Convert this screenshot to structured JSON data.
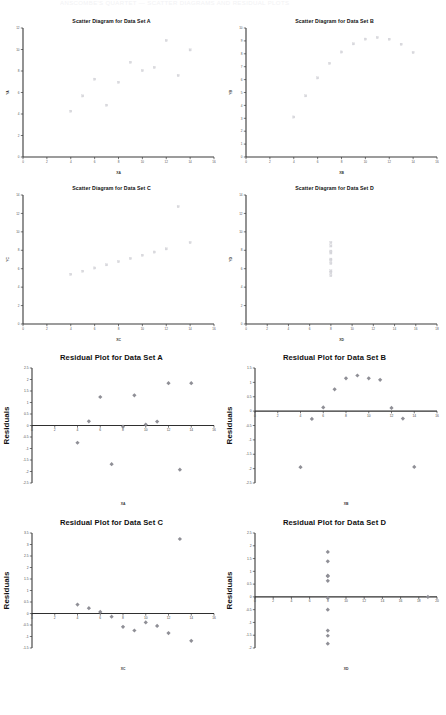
{
  "page": {
    "header_text": "ANSCOMBE'S QUARTET — SCATTER DIAGRAMS AND RESIDUAL PLOTS",
    "background": "#ffffff",
    "scatter_marker_color": "#d9d9de",
    "residual_marker_color": "#8f8f96",
    "axis_color": "#3a3a3a"
  },
  "chart_data": [
    {
      "id": "scatter-a",
      "type": "scatter",
      "title": "Scatter Diagram for Data Set A",
      "xlabel": "XA",
      "ylabel": "YA",
      "xlim": [
        0,
        16
      ],
      "ylim": [
        0,
        12
      ],
      "xticks": [
        0,
        2,
        4,
        6,
        8,
        10,
        12,
        14,
        16
      ],
      "yticks": [
        0,
        2,
        4,
        6,
        8,
        10,
        12
      ],
      "grid": false,
      "legend": "none",
      "x": [
        10,
        8,
        13,
        9,
        11,
        14,
        6,
        4,
        12,
        7,
        5
      ],
      "y": [
        8.04,
        6.95,
        7.58,
        8.81,
        8.33,
        9.96,
        7.24,
        4.26,
        10.84,
        4.82,
        5.68
      ]
    },
    {
      "id": "scatter-b",
      "type": "scatter",
      "title": "Scatter Diagram for Data Set B",
      "xlabel": "XB",
      "ylabel": "YB",
      "xlim": [
        0,
        16
      ],
      "ylim": [
        0,
        10
      ],
      "xticks": [
        0,
        2,
        4,
        6,
        8,
        10,
        12,
        14,
        16
      ],
      "yticks": [
        0,
        1,
        2,
        3,
        4,
        5,
        6,
        7,
        8,
        9,
        10
      ],
      "grid": false,
      "legend": "none",
      "x": [
        10,
        8,
        13,
        9,
        11,
        14,
        6,
        4,
        12,
        7,
        5
      ],
      "y": [
        9.14,
        8.14,
        8.74,
        8.77,
        9.26,
        8.1,
        6.13,
        3.1,
        9.13,
        7.26,
        4.74
      ]
    },
    {
      "id": "scatter-c",
      "type": "scatter",
      "title": "Scatter Diagram for Data Set C",
      "xlabel": "XC",
      "ylabel": "YC",
      "xlim": [
        0,
        16
      ],
      "ylim": [
        0,
        14
      ],
      "xticks": [
        0,
        2,
        4,
        6,
        8,
        10,
        12,
        14,
        16
      ],
      "yticks": [
        0,
        2,
        4,
        6,
        8,
        10,
        12,
        14
      ],
      "grid": false,
      "legend": "none",
      "x": [
        10,
        8,
        13,
        9,
        11,
        14,
        6,
        4,
        12,
        7,
        5
      ],
      "y": [
        7.46,
        6.77,
        12.74,
        7.11,
        7.81,
        8.84,
        6.08,
        5.39,
        8.15,
        6.42,
        5.73
      ]
    },
    {
      "id": "scatter-d",
      "type": "scatter",
      "title": "Scatter Diagram for Data Set D",
      "xlabel": "XD",
      "ylabel": "YD",
      "xlim": [
        0,
        18
      ],
      "ylim": [
        0,
        14
      ],
      "xticks": [
        0,
        2,
        4,
        6,
        8,
        10,
        12,
        14,
        16,
        18
      ],
      "yticks": [
        0,
        2,
        4,
        6,
        8,
        10,
        12,
        14
      ],
      "grid": false,
      "legend": "none",
      "x": [
        8,
        8,
        8,
        8,
        8,
        8,
        8,
        19,
        8,
        8,
        8
      ],
      "y": [
        6.58,
        5.76,
        7.71,
        8.84,
        8.47,
        7.04,
        5.25,
        12.5,
        5.56,
        7.91,
        6.89
      ]
    },
    {
      "id": "residual-a",
      "type": "scatter",
      "title": "Residual Plot for Data Set A",
      "xlabel": "XA",
      "ylabel": "Residuals",
      "xlim": [
        0,
        16
      ],
      "ylim": [
        -2.5,
        2.5
      ],
      "xticks": [
        0,
        2,
        4,
        6,
        8,
        10,
        12,
        14,
        16
      ],
      "yticks": [
        -2.5,
        -2,
        -1.5,
        -1,
        -0.5,
        0,
        0.5,
        1,
        1.5,
        2,
        2.5
      ],
      "grid": false,
      "legend": "none",
      "x": [
        10,
        8,
        13,
        9,
        11,
        14,
        6,
        4,
        12,
        7,
        5
      ],
      "y": [
        0.04,
        -0.05,
        -1.92,
        1.31,
        0.17,
        1.84,
        1.24,
        -0.75,
        1.84,
        -1.68,
        0.18
      ]
    },
    {
      "id": "residual-b",
      "type": "scatter",
      "title": "Residual Plot for Data Set B",
      "xlabel": "XB",
      "ylabel": "Residuals",
      "xlim": [
        0,
        16
      ],
      "ylim": [
        -2.5,
        1.5
      ],
      "xticks": [
        0,
        2,
        4,
        6,
        8,
        10,
        12,
        14,
        16
      ],
      "yticks": [
        -2.5,
        -2,
        -1.5,
        -1,
        -0.5,
        0,
        0.5,
        1,
        1.5
      ],
      "grid": false,
      "legend": "none",
      "x": [
        10,
        8,
        13,
        9,
        11,
        14,
        6,
        4,
        12,
        7,
        5
      ],
      "y": [
        1.14,
        1.14,
        -0.26,
        1.24,
        1.09,
        -1.94,
        0.13,
        -1.95,
        0.11,
        0.76,
        -0.27
      ]
    },
    {
      "id": "residual-c",
      "type": "scatter",
      "title": "Residual Plot for Data Set C",
      "xlabel": "XC",
      "ylabel": "Residuals",
      "xlim": [
        0,
        16
      ],
      "ylim": [
        -1.5,
        3.5
      ],
      "xticks": [
        0,
        2,
        4,
        6,
        8,
        10,
        12,
        14,
        16
      ],
      "yticks": [
        -1.5,
        -1,
        -0.5,
        0,
        0.5,
        1,
        1.5,
        2,
        2.5,
        3,
        3.5
      ],
      "grid": false,
      "legend": "none",
      "x": [
        10,
        8,
        13,
        9,
        11,
        14,
        6,
        4,
        12,
        7,
        5
      ],
      "y": [
        -0.39,
        -0.58,
        3.24,
        -0.74,
        -0.54,
        -1.19,
        0.07,
        0.39,
        -0.85,
        -0.14,
        0.23
      ]
    },
    {
      "id": "residual-d",
      "type": "scatter",
      "title": "Residual Plot for Data Set D",
      "xlabel": "XD",
      "ylabel": "Residuals",
      "xlim": [
        0,
        20
      ],
      "ylim": [
        -2,
        2.5
      ],
      "xticks": [
        0,
        2,
        4,
        6,
        8,
        10,
        12,
        14,
        16,
        18,
        20
      ],
      "yticks": [
        -2,
        -1.5,
        -1,
        -0.5,
        0,
        0.5,
        1,
        1.5,
        2,
        2.5
      ],
      "grid": false,
      "legend": "none",
      "x": [
        8,
        8,
        8,
        8,
        8,
        8,
        8,
        19,
        8,
        8,
        8
      ],
      "y": [
        -0.5,
        -1.32,
        0.63,
        1.76,
        1.39,
        -0.04,
        -1.83,
        0.0,
        -1.52,
        0.83,
        0.81
      ]
    }
  ]
}
